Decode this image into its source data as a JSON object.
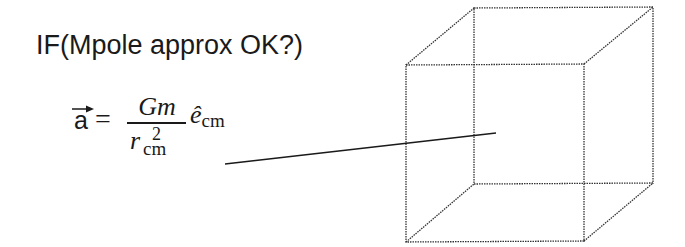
{
  "slide": {
    "title": "IF(Mpole approx OK?)",
    "equation": {
      "lhs": "a",
      "equals": "=",
      "numerator": "Gm",
      "denominator_base": "r",
      "denominator_sup": "2",
      "denominator_sub": "cm",
      "unit_vector": "ê",
      "unit_vector_sub": "cm"
    },
    "diagram": {
      "shape": "wireframe-cube",
      "pointer_line": "line-to-cube-center"
    }
  }
}
